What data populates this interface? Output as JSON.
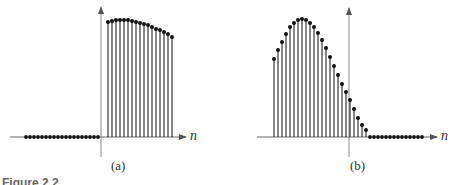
{
  "figure": {
    "caption_partial": "Figure 2.2"
  },
  "chart_data": [
    {
      "type": "stem",
      "label": "(a)",
      "xlabel": "n",
      "axis": {
        "x_origin_px": 101,
        "baseline_px": 137,
        "x_start_px": 10,
        "x_end_px": 186,
        "y_top_px": 7,
        "y_bottom_px": 157
      },
      "spacing_px": 4,
      "zero_samples": {
        "start_px": 26,
        "count": 19
      },
      "stems": {
        "start_px": 108,
        "heights": [
          115,
          116,
          117,
          117,
          117,
          117,
          116,
          115,
          114,
          113,
          112,
          110,
          108,
          107,
          105,
          103,
          100
        ]
      },
      "description": "Signal zero for n<0, large nonzero samples for n>=0 (right-sided sequence)"
    },
    {
      "type": "stem",
      "label": "(b)",
      "xlabel": "n",
      "axis": {
        "x_origin_px": 349,
        "baseline_px": 137,
        "x_start_px": 257,
        "x_end_px": 437,
        "y_top_px": 8,
        "y_bottom_px": 157
      },
      "spacing_px": 4,
      "stems": {
        "start_px": 274,
        "heights": [
          78,
          87,
          95,
          103,
          110,
          114,
          117,
          118,
          117,
          114,
          110,
          104,
          97,
          89,
          80,
          71,
          62,
          53,
          45,
          37,
          28,
          19,
          12,
          7
        ]
      },
      "zero_samples": {
        "start_px": 370,
        "count": 14
      },
      "description": "Signal nonzero for n<0 region, decaying to zero shortly after n=0 (left-sided sequence)"
    }
  ],
  "labels": {
    "a_caption": "(a)",
    "b_caption": "(b)",
    "a_n": "n",
    "b_n": "n"
  }
}
